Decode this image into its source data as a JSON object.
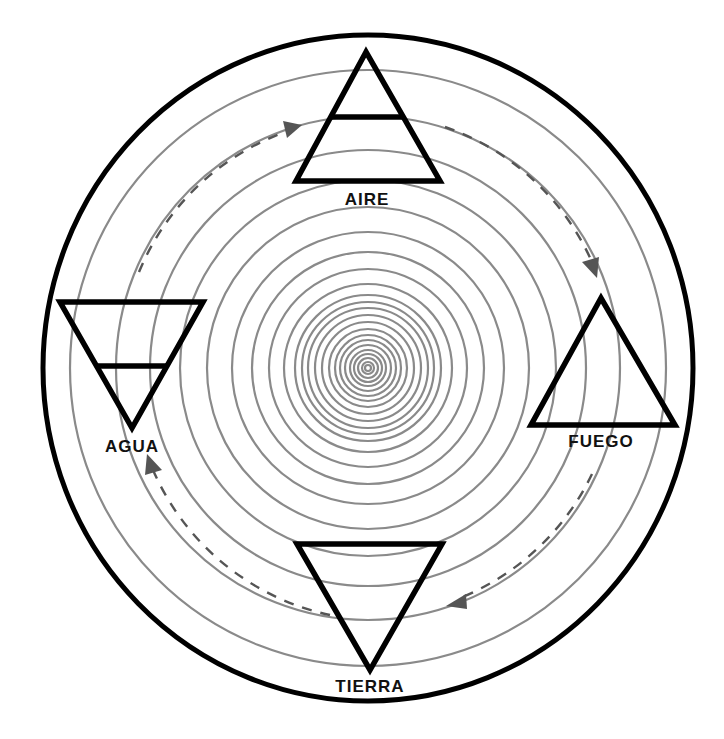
{
  "diagram": {
    "type": "cycle-of-elements",
    "elements": [
      {
        "label": "AIRE",
        "symbol": "triangle-up-with-bar",
        "position": "top"
      },
      {
        "label": "FUEGO",
        "symbol": "triangle-up",
        "position": "right"
      },
      {
        "label": "TIERRA",
        "symbol": "triangle-down",
        "position": "bottom"
      },
      {
        "label": "AGUA",
        "symbol": "triangle-down-with-bar",
        "position": "left"
      }
    ],
    "flow": [
      "AGUA",
      "AIRE",
      "FUEGO",
      "TIERRA",
      "AGUA"
    ],
    "flow_direction": "clockwise",
    "colors": {
      "rings": "#8a8a8a",
      "outline": "#000000",
      "arrows": "#555555"
    }
  }
}
